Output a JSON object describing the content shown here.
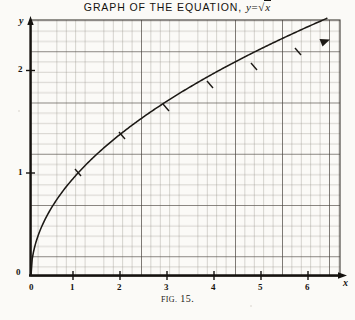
{
  "figure": {
    "title_prefix": "GRAPH OF THE EQUATION,",
    "equation_lhs": "y",
    "equation_eq": "=",
    "equation_radical": "√",
    "equation_radicand": "x",
    "caption_label": "FIG.",
    "caption_number": "15.",
    "background_color": "#fbfaf7",
    "ink_color": "#14110e",
    "grid_color": "#6f6b64",
    "grid_major_color": "#3a3631"
  },
  "axes": {
    "x_var": "x",
    "y_var": "y",
    "origin_label": "0",
    "x_ticks": [
      "0",
      "1",
      "2",
      "3",
      "4",
      "5",
      "6"
    ],
    "y_ticks": [
      "1",
      "2"
    ],
    "x_min": 0,
    "x_max": 6.6,
    "y_min": 0,
    "y_max": 2.6,
    "grid_minor_per_unit": 10,
    "grid_major_every": 5
  },
  "chart_data": {
    "type": "line",
    "subtitle": "FIG. 15.",
    "xlabel": "x",
    "ylabel": "y",
    "xlim": [
      0,
      6.6
    ],
    "ylim": [
      0,
      2.6
    ],
    "grid": true,
    "legend": "none",
    "equation": "y = sqrt(x)",
    "annotations": [
      "arrowhead at curve end",
      "arrowhead on x-axis",
      "arrowhead on y-axis"
    ],
    "series": [
      {
        "name": "y = √x",
        "x": [
          0,
          0.1,
          0.2,
          0.3,
          0.4,
          0.5,
          0.6,
          0.7,
          0.8,
          0.9,
          1.0,
          1.2,
          1.4,
          1.6,
          1.8,
          2.0,
          2.5,
          3.0,
          3.5,
          4.0,
          4.5,
          5.0,
          5.5,
          6.0,
          6.5
        ],
        "y": [
          0,
          0.316,
          0.447,
          0.548,
          0.632,
          0.707,
          0.775,
          0.837,
          0.894,
          0.949,
          1.0,
          1.095,
          1.183,
          1.265,
          1.342,
          1.414,
          1.581,
          1.732,
          1.871,
          2.0,
          2.121,
          2.236,
          2.345,
          2.449,
          2.55
        ]
      }
    ],
    "plotted_points": [
      {
        "x": 0,
        "y": 0
      },
      {
        "x": 1,
        "y": 1
      },
      {
        "x": 2,
        "y": 1.41
      },
      {
        "x": 3,
        "y": 1.73
      },
      {
        "x": 4,
        "y": 2.0
      },
      {
        "x": 5,
        "y": 2.24
      },
      {
        "x": 6,
        "y": 2.45
      }
    ]
  }
}
